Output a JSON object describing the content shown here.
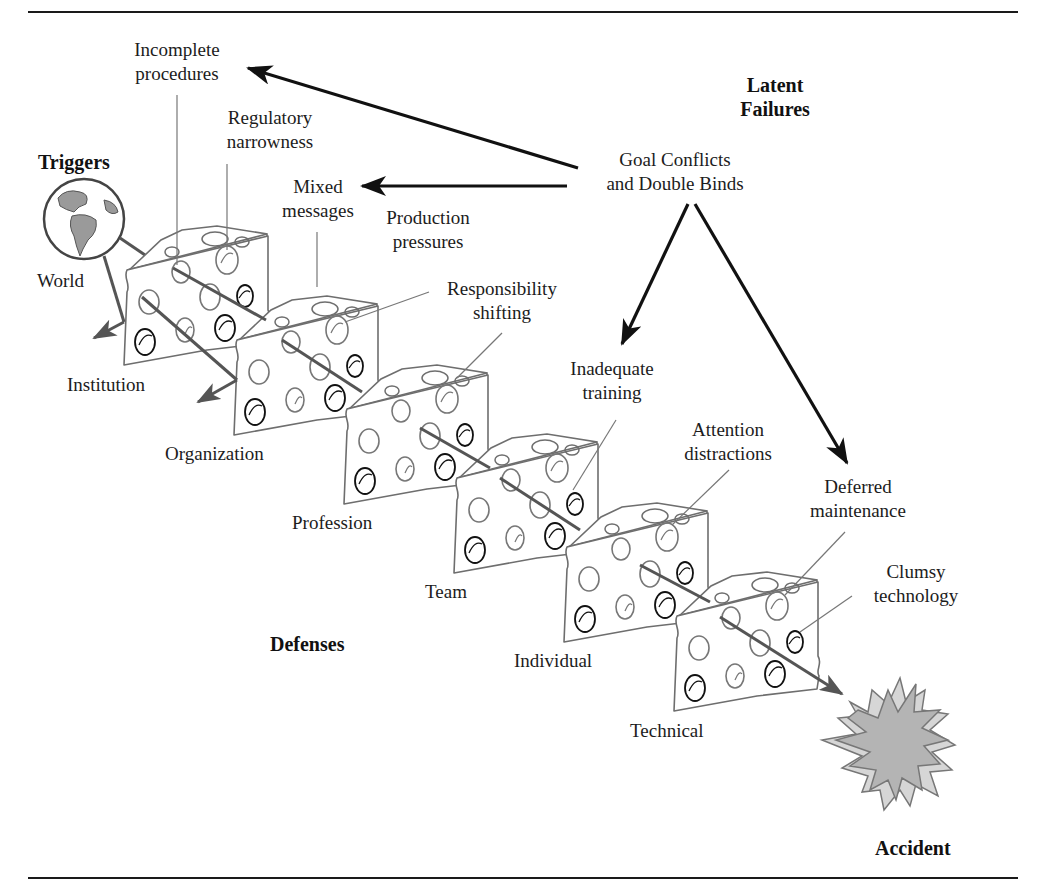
{
  "diagram": {
    "type": "swiss-cheese-model",
    "headings": {
      "triggers": "Triggers",
      "latent_failures": [
        "Latent",
        "Failures"
      ],
      "defenses": "Defenses",
      "accident": "Accident"
    },
    "source": {
      "label": [
        "Goal Conflicts",
        "and Double Binds"
      ]
    },
    "trigger": {
      "label": "World",
      "icon": "globe-icon"
    },
    "layers": [
      {
        "name": "Institution"
      },
      {
        "name": "Organization"
      },
      {
        "name": "Profession"
      },
      {
        "name": "Team"
      },
      {
        "name": "Individual"
      },
      {
        "name": "Technical"
      }
    ],
    "latent_failures": [
      {
        "label": [
          "Incomplete",
          "procedures"
        ]
      },
      {
        "label": [
          "Regulatory",
          "narrowness"
        ]
      },
      {
        "label": [
          "Mixed",
          "messages"
        ]
      },
      {
        "label": [
          "Production",
          "pressures"
        ]
      },
      {
        "label": [
          "Responsibility",
          "shifting"
        ]
      },
      {
        "label": [
          "Inadequate",
          "training"
        ]
      },
      {
        "label": [
          "Attention",
          "distractions"
        ]
      },
      {
        "label": [
          "Deferred",
          "maintenance"
        ]
      },
      {
        "label": [
          "Clumsy",
          "technology"
        ]
      }
    ],
    "colors": {
      "ink": "#1a1a1a",
      "outline_gray": "#6e6e6e",
      "land": "#9a9a9a",
      "burst_dark": "#b4b4b4",
      "burst_light": "#d6d6d6",
      "background": "#ffffff"
    }
  }
}
